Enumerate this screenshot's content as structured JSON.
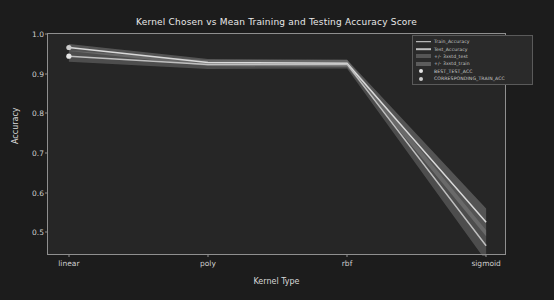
{
  "chart_data": {
    "type": "line",
    "title": "Kernel Chosen vs Mean Training and Testing Accuracy Score",
    "xlabel": "Kernel Type",
    "ylabel": "Accuracy",
    "categories": [
      "linear",
      "poly",
      "rbf",
      "sigmoid"
    ],
    "xtick_labels": [
      "linear",
      "poly",
      "rbf",
      "sigmoid"
    ],
    "ytick_labels": [
      "0.5",
      "0.6",
      "0.7",
      "0.8",
      "0.9",
      "1.0"
    ],
    "ytick_values": [
      0.5,
      0.6,
      0.7,
      0.8,
      0.9,
      1.0
    ],
    "ylim": [
      0.44,
      1.0
    ],
    "xlim": [
      -0.15,
      3.15
    ],
    "grid": false,
    "legend_position": "upper right",
    "series": [
      {
        "name": "Train_Accuracy",
        "color": "#d9d9d9",
        "values": [
          0.966,
          0.928,
          0.926,
          0.525
        ],
        "band_name": "+/- 3xstd_train",
        "band_color": "#9a9a9a",
        "band_upper": [
          0.975,
          0.937,
          0.935,
          0.56
        ],
        "band_lower": [
          0.957,
          0.919,
          0.917,
          0.49
        ]
      },
      {
        "name": "Test_Accuracy",
        "color": "#bfbfbf",
        "values": [
          0.944,
          0.923,
          0.924,
          0.466
        ],
        "band_name": "+/- 3xstd_test",
        "band_color": "#8a8a8a",
        "band_upper": [
          0.958,
          0.934,
          0.935,
          0.505
        ],
        "band_lower": [
          0.93,
          0.912,
          0.913,
          0.427
        ]
      }
    ],
    "markers": [
      {
        "name": "BEST_TEST_ACC",
        "color": "#e6e6e6",
        "x": "linear",
        "y": 0.944
      },
      {
        "name": "CORRESPONDING_TRAIN_ACC",
        "color": "#cccccc",
        "x": "linear",
        "y": 0.966
      }
    ]
  },
  "legend": {
    "entries": [
      {
        "label": "Train_Accuracy",
        "key": "line",
        "color": "#d9d9d9"
      },
      {
        "label": "Test_Accuracy",
        "key": "line",
        "color": "#bfbfbf"
      },
      {
        "label": "+/- 3xstd_test",
        "key": "band",
        "color": "#8a8a8a"
      },
      {
        "label": "+/- 3xstd_train",
        "key": "band",
        "color": "#9a9a9a"
      },
      {
        "label": "BEST_TEST_ACC",
        "key": "dot",
        "color": "#e6e6e6"
      },
      {
        "label": "CORRESPONDING_TRAIN_ACC",
        "key": "dot",
        "color": "#cccccc"
      }
    ]
  },
  "colors": {
    "figure_background": "#1c1c1c",
    "axes_background": "#262626",
    "axis_line": "#8f8f8f",
    "text": "#d8d8d8"
  }
}
